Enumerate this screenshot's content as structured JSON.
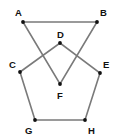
{
  "diagram": {
    "type": "geometry",
    "colors": {
      "edge": "#7a7a7a",
      "vertex": "#111111",
      "label": "#111111",
      "background": "#ffffff"
    },
    "points": {
      "A": {
        "label": "A",
        "x": 23,
        "y": 22,
        "lx": 15,
        "ly": 16
      },
      "B": {
        "label": "B",
        "x": 97,
        "y": 22,
        "lx": 100,
        "ly": 16
      },
      "C": {
        "label": "C",
        "x": 20,
        "y": 72,
        "lx": 9,
        "ly": 68
      },
      "D": {
        "label": "D",
        "x": 60,
        "y": 43,
        "lx": 57,
        "ly": 38
      },
      "E": {
        "label": "E",
        "x": 100,
        "y": 73,
        "lx": 103,
        "ly": 68
      },
      "F": {
        "label": "F",
        "x": 60,
        "y": 84,
        "lx": 57,
        "ly": 99
      },
      "G": {
        "label": "G",
        "x": 35,
        "y": 120,
        "lx": 25,
        "ly": 134
      },
      "H": {
        "label": "H",
        "x": 85,
        "y": 120,
        "lx": 88,
        "ly": 134
      }
    },
    "shapes": [
      {
        "name": "triangle-ABF",
        "vertices": [
          "A",
          "B",
          "F"
        ]
      },
      {
        "name": "pentagon-CDEHG",
        "vertices": [
          "C",
          "D",
          "E",
          "H",
          "G"
        ]
      }
    ]
  }
}
